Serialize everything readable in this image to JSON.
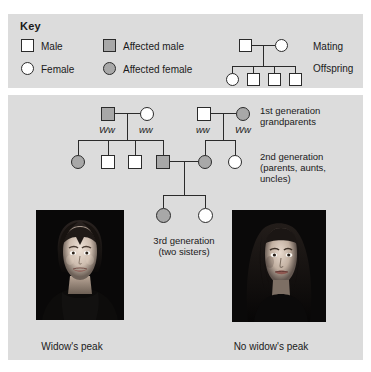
{
  "key": {
    "title": "Key",
    "items": [
      {
        "label": "Male",
        "icon": "square-unaffected-icon",
        "shape": "square",
        "state": "unaffected"
      },
      {
        "label": "Female",
        "icon": "circle-unaffected-icon",
        "shape": "circle",
        "state": "unaffected"
      },
      {
        "label": "Affected male",
        "icon": "square-affected-icon",
        "shape": "square",
        "state": "affected"
      },
      {
        "label": "Affected female",
        "icon": "circle-affected-icon",
        "shape": "circle",
        "state": "affected"
      }
    ],
    "mating_label": "Mating",
    "offspring_label": "Offspring",
    "example": {
      "parents": [
        {
          "shape": "square",
          "state": "unaffected"
        },
        {
          "shape": "circle",
          "state": "unaffected"
        }
      ],
      "children": [
        {
          "shape": "circle",
          "state": "unaffected"
        },
        {
          "shape": "square",
          "state": "unaffected"
        },
        {
          "shape": "square",
          "state": "unaffected"
        },
        {
          "shape": "square",
          "state": "unaffected"
        }
      ]
    }
  },
  "pedigree": {
    "generation1": {
      "label_line1": "1st generation",
      "label_line2": "grandparents",
      "individuals": [
        {
          "shape": "square",
          "state": "affected",
          "genotype": "Ww"
        },
        {
          "shape": "circle",
          "state": "unaffected",
          "genotype": "ww"
        },
        {
          "shape": "square",
          "state": "unaffected",
          "genotype": "ww"
        },
        {
          "shape": "circle",
          "state": "affected",
          "genotype": "Ww"
        }
      ]
    },
    "generation2": {
      "label_line1": "2nd generation",
      "label_line2": "(parents, aunts,",
      "label_line3": "uncles)",
      "individuals": [
        {
          "shape": "circle",
          "state": "affected"
        },
        {
          "shape": "square",
          "state": "unaffected"
        },
        {
          "shape": "square",
          "state": "unaffected"
        },
        {
          "shape": "square",
          "state": "affected"
        },
        {
          "shape": "circle",
          "state": "affected"
        },
        {
          "shape": "circle",
          "state": "unaffected"
        }
      ]
    },
    "generation3": {
      "label_line1": "3rd generation",
      "label_line2": "(two sisters)",
      "individuals": [
        {
          "shape": "circle",
          "state": "affected"
        },
        {
          "shape": "circle",
          "state": "unaffected"
        }
      ]
    }
  },
  "photos": {
    "left": {
      "caption": "Widow's peak",
      "alt": "woman-with-widows-peak"
    },
    "right": {
      "caption": "No widow's peak",
      "alt": "woman-without-widows-peak"
    }
  },
  "colors": {
    "panel_bg": "#dcdcdc",
    "affected_fill": "#a8a8a8",
    "unaffected_fill": "#ffffff",
    "line": "#2b2b2b",
    "text": "#1a1a1a"
  }
}
